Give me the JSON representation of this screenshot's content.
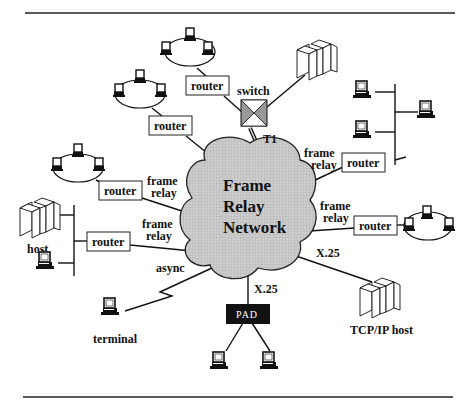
{
  "diagram": {
    "title_cloud": [
      "Frame",
      "Relay",
      "Network"
    ],
    "labels": {
      "router": "router",
      "switch": "switch",
      "t1": "T1",
      "frame": "frame",
      "relay": "relay",
      "async": "async",
      "x25": "X.25",
      "pad": "PAD",
      "host": "host",
      "terminal": "terminal",
      "tcpip_host": "TCP/IP host"
    },
    "colors": {
      "cloud_fill": "#c8c8c8",
      "cloud_grid": "#b0b0b0",
      "pad_fill": "#111111",
      "line": "#111111"
    },
    "nodes": [
      {
        "id": "router-top",
        "type": "router",
        "label": "router"
      },
      {
        "id": "router-upper-left",
        "type": "router",
        "label": "router"
      },
      {
        "id": "router-left",
        "type": "router",
        "label": "router",
        "link": "frame relay"
      },
      {
        "id": "router-host-left",
        "type": "router",
        "label": "router",
        "link": "frame relay"
      },
      {
        "id": "router-right-top",
        "type": "router",
        "label": "router",
        "link": "frame relay"
      },
      {
        "id": "router-right-mid",
        "type": "router",
        "label": "router",
        "link": "frame relay"
      },
      {
        "id": "switch",
        "type": "switch",
        "label": "switch",
        "link": "T1"
      },
      {
        "id": "pad",
        "type": "pad",
        "label": "PAD",
        "link": "X.25"
      },
      {
        "id": "tcpip-host",
        "type": "host",
        "label": "TCP/IP host",
        "link": "X.25"
      },
      {
        "id": "terminal",
        "type": "terminal",
        "label": "terminal",
        "link": "async"
      },
      {
        "id": "host",
        "type": "host",
        "label": "host"
      }
    ]
  }
}
